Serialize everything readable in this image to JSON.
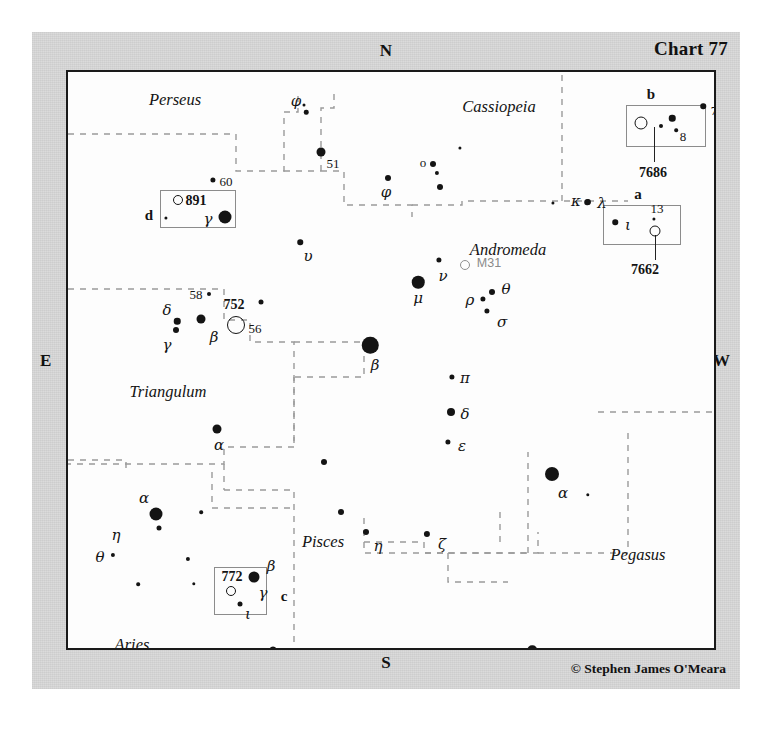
{
  "chart": {
    "number_label": "Chart 77",
    "credit": "© Stephen James O'Meara",
    "compass": {
      "n": "N",
      "s": "S",
      "e": "E",
      "w": "W"
    }
  },
  "constellations": [
    {
      "name": "Perseus",
      "x": 107,
      "y": 28
    },
    {
      "name": "Cassiopeia",
      "x": 431,
      "y": 35
    },
    {
      "name": "Andromeda",
      "x": 440,
      "y": 178
    },
    {
      "name": "Triangulum",
      "x": 100,
      "y": 320
    },
    {
      "name": "Pisces",
      "x": 255,
      "y": 470
    },
    {
      "name": "Pegasus",
      "x": 570,
      "y": 483
    },
    {
      "name": "Aries",
      "x": 64,
      "y": 573
    }
  ],
  "insets": [
    {
      "id": "b",
      "letter": "b",
      "letter_x": 583,
      "letter_y": 22,
      "box_x": 558,
      "box_y": 33,
      "box_w": 80,
      "box_h": 42,
      "catalog": "7686",
      "catalog_x": 585,
      "catalog_y": 101,
      "leader_x": 586,
      "leader_y1": 55,
      "leader_y2": 90,
      "nebula": {
        "x": 573,
        "y": 51,
        "d": 11
      },
      "stars": [
        {
          "x": 604,
          "y": 46,
          "d": 6.5
        },
        {
          "x": 593,
          "y": 54,
          "d": 4.0
        },
        {
          "x": 608,
          "y": 58,
          "d": 3.6
        },
        {
          "x": 635,
          "y": 34,
          "d": 5.5
        }
      ],
      "labels": [
        {
          "text": "8",
          "x": 615,
          "y": 64,
          "cls": "num"
        },
        {
          "text": "7",
          "x": 646,
          "y": 38,
          "cls": "num"
        }
      ]
    },
    {
      "id": "a",
      "letter": "a",
      "letter_x": 570,
      "letter_y": 122,
      "box_x": 535,
      "box_y": 133,
      "box_w": 78,
      "box_h": 40,
      "catalog": "7662",
      "catalog_x": 577,
      "catalog_y": 198,
      "leader_x": 587,
      "leader_y1": 163,
      "leader_y2": 188,
      "nebula": {
        "x": 587,
        "y": 159,
        "d": 9
      },
      "stars": [
        {
          "x": 547,
          "y": 150,
          "d": 5.5
        },
        {
          "x": 586,
          "y": 147,
          "d": 3.2
        },
        {
          "x": 519,
          "y": 130,
          "d": 5.5
        }
      ],
      "labels": [
        {
          "text": "ι",
          "x": 560,
          "y": 153,
          "cls": "greek"
        },
        {
          "text": "13",
          "x": 589,
          "y": 136,
          "cls": "num"
        },
        {
          "text": "κ",
          "x": 508,
          "y": 129,
          "cls": "greek"
        }
      ]
    },
    {
      "id": "d",
      "letter": "d",
      "letter_x": 81,
      "letter_y": 143,
      "box_x": 92,
      "box_y": 118,
      "box_w": 76,
      "box_h": 38,
      "catalog": "891",
      "catalog_x": 128,
      "catalog_y": 129,
      "leader_x": 0,
      "leader_y1": 0,
      "leader_y2": 0,
      "nebula": {
        "x": 110,
        "y": 128,
        "d": 8
      },
      "stars": [
        {
          "x": 98,
          "y": 146,
          "d": 3.2
        },
        {
          "x": 157,
          "y": 145,
          "d": 13
        }
      ],
      "labels": [
        {
          "text": "γ",
          "x": 140,
          "y": 147,
          "cls": "greek"
        }
      ]
    },
    {
      "id": "c",
      "letter": "c",
      "letter_x": 216,
      "letter_y": 524,
      "box_x": 146,
      "box_y": 495,
      "box_w": 53,
      "box_h": 48,
      "catalog": "772",
      "catalog_x": 164,
      "catalog_y": 505,
      "leader_x": 0,
      "leader_y1": 0,
      "leader_y2": 0,
      "nebula": {
        "x": 163,
        "y": 519,
        "d": 8
      },
      "stars": [
        {
          "x": 186,
          "y": 505,
          "d": 11
        },
        {
          "x": 172,
          "y": 532,
          "d": 5.0
        }
      ],
      "labels": [
        {
          "text": "γ",
          "x": 195,
          "y": 521,
          "cls": "greek"
        },
        {
          "text": "ι",
          "x": 180,
          "y": 542,
          "cls": "greek"
        }
      ]
    }
  ],
  "stars": [
    {
      "x": 238,
      "y": 40,
      "d": 4.5
    },
    {
      "x": 236,
      "y": 33,
      "d": 3.0
    },
    {
      "x": 253,
      "y": 80,
      "d": 9.0
    },
    {
      "x": 320,
      "y": 106,
      "d": 6.0
    },
    {
      "x": 365,
      "y": 92,
      "d": 6.0
    },
    {
      "x": 369,
      "y": 101,
      "d": 4.2
    },
    {
      "x": 372,
      "y": 115,
      "d": 6.0
    },
    {
      "x": 392,
      "y": 76,
      "d": 3.2
    },
    {
      "x": 520,
      "y": 130,
      "d": 6.2
    },
    {
      "x": 485,
      "y": 131,
      "d": 3.2
    },
    {
      "x": 145,
      "y": 108,
      "d": 5.2
    },
    {
      "x": 232,
      "y": 170,
      "d": 5.5
    },
    {
      "x": 371,
      "y": 188,
      "d": 5.2
    },
    {
      "x": 350,
      "y": 210,
      "d": 12.5
    },
    {
      "x": 302,
      "y": 273,
      "d": 16.5
    },
    {
      "x": 424,
      "y": 220,
      "d": 6.0
    },
    {
      "x": 415,
      "y": 227,
      "d": 5.2
    },
    {
      "x": 419,
      "y": 239,
      "d": 5.2
    },
    {
      "x": 384,
      "y": 305,
      "d": 5.2
    },
    {
      "x": 383,
      "y": 340,
      "d": 8.0
    },
    {
      "x": 380,
      "y": 370,
      "d": 5.2
    },
    {
      "x": 141,
      "y": 222,
      "d": 4.0
    },
    {
      "x": 193,
      "y": 230,
      "d": 5.0
    },
    {
      "x": 109,
      "y": 249,
      "d": 6.5
    },
    {
      "x": 108,
      "y": 258,
      "d": 6.0
    },
    {
      "x": 133,
      "y": 247,
      "d": 9.0
    },
    {
      "x": 149,
      "y": 357,
      "d": 9.0
    },
    {
      "x": 256,
      "y": 390,
      "d": 6.0
    },
    {
      "x": 273,
      "y": 440,
      "d": 6.0
    },
    {
      "x": 298,
      "y": 460,
      "d": 6.0
    },
    {
      "x": 359,
      "y": 462,
      "d": 6.2
    },
    {
      "x": 484,
      "y": 402,
      "d": 14.0
    },
    {
      "x": 520,
      "y": 423,
      "d": 3.4
    },
    {
      "x": 88,
      "y": 442,
      "d": 13.0
    },
    {
      "x": 91,
      "y": 456,
      "d": 5.0
    },
    {
      "x": 133,
      "y": 440,
      "d": 3.6
    },
    {
      "x": 45,
      "y": 483,
      "d": 4.2
    },
    {
      "x": 120,
      "y": 487,
      "d": 4.2
    },
    {
      "x": 126,
      "y": 512,
      "d": 3.4
    },
    {
      "x": 70,
      "y": 512,
      "d": 3.6
    },
    {
      "x": 205,
      "y": 578,
      "d": 7.0
    },
    {
      "x": 464,
      "y": 578,
      "d": 9.5
    }
  ],
  "nebulae": [
    {
      "x": 168,
      "y": 253,
      "d": 16,
      "faint": false
    },
    {
      "x": 397,
      "y": 193,
      "d": 8,
      "faint": true
    }
  ],
  "labels": [
    {
      "text": "φ",
      "x": 228,
      "y": 29,
      "cls": "greek"
    },
    {
      "text": "51",
      "x": 265,
      "y": 91,
      "cls": "num"
    },
    {
      "text": "φ",
      "x": 318,
      "y": 120,
      "cls": "greek"
    },
    {
      "text": "o",
      "x": 355,
      "y": 90,
      "cls": "num"
    },
    {
      "text": "λ",
      "x": 534,
      "y": 131,
      "cls": "greek"
    },
    {
      "text": "60",
      "x": 158,
      "y": 109,
      "cls": "num"
    },
    {
      "text": "υ",
      "x": 240,
      "y": 184,
      "cls": "greek"
    },
    {
      "text": "M31",
      "x": 421,
      "y": 191,
      "cls": "m31label"
    },
    {
      "text": "ν",
      "x": 375,
      "y": 204,
      "cls": "greek"
    },
    {
      "text": "μ",
      "x": 350,
      "y": 226,
      "cls": "greek"
    },
    {
      "text": "β",
      "x": 307,
      "y": 293,
      "cls": "greek"
    },
    {
      "text": "θ",
      "x": 438,
      "y": 217,
      "cls": "greek"
    },
    {
      "text": "ρ",
      "x": 402,
      "y": 228,
      "cls": "greek"
    },
    {
      "text": "σ",
      "x": 434,
      "y": 250,
      "cls": "greek"
    },
    {
      "text": "π",
      "x": 397,
      "y": 306,
      "cls": "greek"
    },
    {
      "text": "δ",
      "x": 397,
      "y": 342,
      "cls": "greek"
    },
    {
      "text": "ε",
      "x": 394,
      "y": 374,
      "cls": "greek"
    },
    {
      "text": "58",
      "x": 128,
      "y": 222,
      "cls": "num"
    },
    {
      "text": "752",
      "x": 166,
      "y": 233,
      "cls": "num bold"
    },
    {
      "text": "56",
      "x": 187,
      "y": 256,
      "cls": "num"
    },
    {
      "text": "δ",
      "x": 99,
      "y": 238,
      "cls": "greek"
    },
    {
      "text": "γ",
      "x": 99,
      "y": 273,
      "cls": "greek"
    },
    {
      "text": "β",
      "x": 146,
      "y": 265,
      "cls": "greek"
    },
    {
      "text": "α",
      "x": 151,
      "y": 373,
      "cls": "greek"
    },
    {
      "text": "α",
      "x": 495,
      "y": 421,
      "cls": "greek"
    },
    {
      "text": "ζ",
      "x": 374,
      "y": 472,
      "cls": "greek"
    },
    {
      "text": "η",
      "x": 310,
      "y": 474,
      "cls": "greek"
    },
    {
      "text": "α",
      "x": 76,
      "y": 426,
      "cls": "greek"
    },
    {
      "text": "η",
      "x": 48,
      "y": 463,
      "cls": "greek"
    },
    {
      "text": "θ",
      "x": 32,
      "y": 485,
      "cls": "greek"
    },
    {
      "text": "β",
      "x": 203,
      "y": 494,
      "cls": "greek"
    },
    {
      "text": "η",
      "x": 218,
      "y": 592,
      "cls": "greek"
    },
    {
      "text": "γ",
      "x": 479,
      "y": 591,
      "cls": "greek"
    }
  ],
  "boundaries": {
    "stroke": "#9a9a9a",
    "paths": [
      "M 0,62 L 168,62 L 168,99 L 216,99 L 216,40 L 230,40 L 230,20",
      "M 216,99 L 253,99",
      "M 253,99 L 253,36 L 266,36 L 266,20",
      "M 253,99 L 276,99 L 276,133 L 344,133 L 344,145",
      "M 344,133 L 394,133 L 394,129 L 560,129",
      "M 494,129 L 494,0",
      "M 0,217 L 156,217 L 156,248 L 182,248 L 182,270 L 226,270 L 226,375 L 156,375 L 156,392 L 0,392",
      "M 226,270 L 296,270 L 296,305 L 226,305",
      "M 226,305 L 226,375",
      "M 0,388 L 58,388 L 58,401",
      "M 156,392 L 156,418",
      "M 156,418 L 226,418 L 226,440 L 226,500 L 226,560 L 226,620",
      "M 296,446 L 296,470 L 356,470 L 356,481 L 470,481 L 470,460",
      "M 296,470 L 296,481 L 380,481",
      "M 380,481 L 460,481",
      "M 432,470 L 432,436",
      "M 460,481 L 460,420 L 460,380",
      "M 380,481 L 380,510 L 440,510",
      "M 470,481 L 560,481 L 560,420 L 560,355",
      "M 144,400 L 144,436 L 226,436",
      "M 530,340 L 650,340"
    ]
  }
}
